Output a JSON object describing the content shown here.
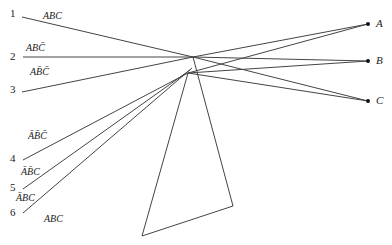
{
  "diagram": {
    "inputs": [
      {
        "number": "1",
        "term": "ABC"
      },
      {
        "number": "2",
        "term": "ABC̄"
      },
      {
        "number": "3",
        "term": "AB̄C̄"
      },
      {
        "number": "4",
        "term": "ĀB̄C̄"
      },
      {
        "number": "5",
        "term": "ĀB̄C"
      },
      {
        "number": "6",
        "term": "ĀBC"
      }
    ],
    "extra_term": "ABC",
    "outputs": [
      "A",
      "B",
      "C"
    ],
    "line_color": "#444444"
  }
}
